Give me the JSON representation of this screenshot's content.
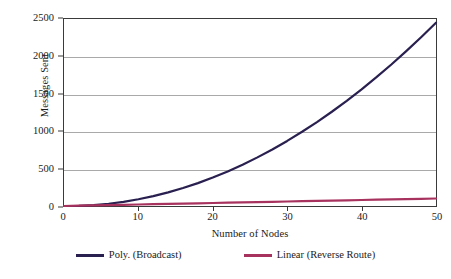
{
  "chart_data": {
    "type": "line",
    "title": "",
    "xlabel": "Number of Nodes",
    "ylabel": "Messages Sent",
    "xlim": [
      0,
      50
    ],
    "ylim": [
      0,
      2500
    ],
    "grid": "horizontal",
    "legend_position": "bottom",
    "x_ticks": [
      "0",
      "10",
      "20",
      "30",
      "40",
      "50"
    ],
    "y_ticks": [
      "0",
      "500",
      "1000",
      "1500",
      "2000",
      "2500"
    ],
    "x_tick_values": [
      0,
      10,
      20,
      30,
      40,
      50
    ],
    "y_tick_values": [
      0,
      500,
      1000,
      1500,
      2000,
      2500
    ],
    "x": [
      0,
      2,
      4,
      6,
      8,
      10,
      12,
      14,
      16,
      18,
      20,
      22,
      24,
      26,
      28,
      30,
      32,
      34,
      36,
      38,
      40,
      42,
      44,
      46,
      48,
      50
    ],
    "series": [
      {
        "name": "Poly. (Broadcast)",
        "color": "#2a2050",
        "values": [
          0,
          2,
          12,
          30,
          56,
          90,
          132,
          182,
          240,
          306,
          380,
          462,
          552,
          650,
          756,
          870,
          992,
          1122,
          1260,
          1406,
          1560,
          1722,
          1892,
          2070,
          2256,
          2450
        ]
      },
      {
        "name": "Linear (Reverse Route)",
        "color": "#a8325e",
        "values": [
          0,
          4,
          8,
          12,
          16,
          20,
          24,
          28,
          32,
          36,
          40,
          44,
          48,
          52,
          56,
          60,
          64,
          68,
          72,
          76,
          80,
          84,
          88,
          92,
          96,
          100
        ]
      }
    ]
  },
  "legend": {
    "items": [
      {
        "label": "Poly. (Broadcast)",
        "color": "#2a2050"
      },
      {
        "label": "Linear (Reverse Route)",
        "color": "#a8325e"
      }
    ]
  },
  "axes": {
    "y_title": "Messages Sent",
    "x_title": "Number of Nodes"
  },
  "colors": {
    "plot_border": "#3a3a3a",
    "gridline": "#a9a9a9",
    "background": "#ffffff",
    "poly_series": "#2a2050",
    "linear_series": "#a8325e"
  }
}
